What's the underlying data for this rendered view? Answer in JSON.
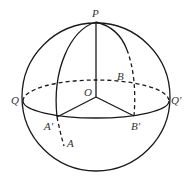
{
  "figure": {
    "stroke_color": "#1a1a1a",
    "label_color": "#333333",
    "labels": {
      "P": "P",
      "O": "O",
      "Q": "Q",
      "Q_prime": "Q'",
      "A_prime": "A'",
      "B_prime": "B'",
      "A": "A",
      "B": "B"
    }
  }
}
